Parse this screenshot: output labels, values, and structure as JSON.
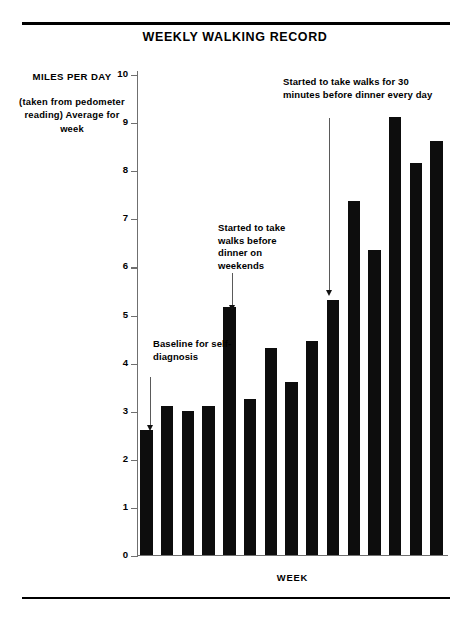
{
  "chart_data": {
    "type": "bar",
    "title": "WEEKLY WALKING RECORD",
    "xlabel": "WEEK",
    "ylabel": "MILES PER DAY",
    "ylabel_note": "(taken from pedometer reading) Average for week",
    "categories": [
      "1",
      "2",
      "3",
      "4",
      "5",
      "6",
      "7",
      "8",
      "9",
      "10",
      "11",
      "12",
      "13",
      "14",
      "15"
    ],
    "values": [
      2.6,
      3.1,
      3.0,
      3.1,
      5.15,
      3.25,
      4.3,
      3.6,
      4.45,
      5.3,
      7.35,
      6.35,
      9.1,
      8.15,
      8.6
    ],
    "ylim": [
      0,
      10
    ],
    "yticks": [
      "0",
      "1",
      "2",
      "3",
      "4",
      "5",
      "6",
      "7",
      "8",
      "9",
      "10"
    ],
    "grid": false,
    "legend": "none",
    "bar_color": "#0d0d0d",
    "annotations": [
      {
        "text": "Baseline for self-diagnosis",
        "target_category": "1"
      },
      {
        "text": "Started to take walks before dinner on weekends",
        "target_category": "5"
      },
      {
        "text": "Started to take walks for 30 minutes before dinner every day",
        "target_category": "10"
      }
    ]
  },
  "chart": {
    "title": "WEEKLY WALKING RECORD",
    "y_axis_title": "MILES PER DAY",
    "y_axis_note": "(taken from pedometer reading) Average for week",
    "x_axis_title": "WEEK",
    "annotation_1": "Baseline for self-diagnosis",
    "annotation_2": "Started to take walks before dinner on weekends",
    "annotation_3": "Started to take walks for 30 minutes before dinner every day"
  }
}
